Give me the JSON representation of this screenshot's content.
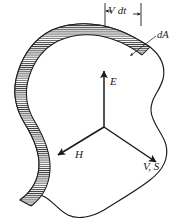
{
  "figure": {
    "background_color": "#ffffff",
    "ink_color": "#1b1b1b",
    "hatch_color": "#3a3a3a",
    "width": 183,
    "height": 223
  },
  "labels": {
    "vdt": "V dt",
    "da": "dA",
    "e_field": "E",
    "h_field": "H",
    "v_s": "V, S"
  },
  "vectors": [
    {
      "name": "E",
      "label": "E",
      "direction": "up",
      "origin": [
        104,
        127
      ],
      "tip": [
        104,
        70
      ]
    },
    {
      "name": "H",
      "label": "H",
      "direction": "down-left",
      "origin": [
        104,
        127
      ],
      "tip": [
        57,
        156
      ]
    },
    {
      "name": "V, S",
      "label": "V, S",
      "direction": "down-right",
      "origin": [
        104,
        127
      ],
      "tip": [
        157,
        163
      ]
    }
  ],
  "annotations": {
    "dimension": {
      "label": "V dt",
      "left_tick_x": 105,
      "right_tick_x": 141,
      "tick_top_y": 3,
      "tick_bottom_y": 26
    },
    "leader": {
      "label": "dA",
      "from": [
        156,
        36
      ],
      "to": [
        130,
        56
      ]
    }
  },
  "shapes": {
    "surface_outline": "irregular closed blob",
    "swept_band": "hatched band along upper-left edge"
  }
}
